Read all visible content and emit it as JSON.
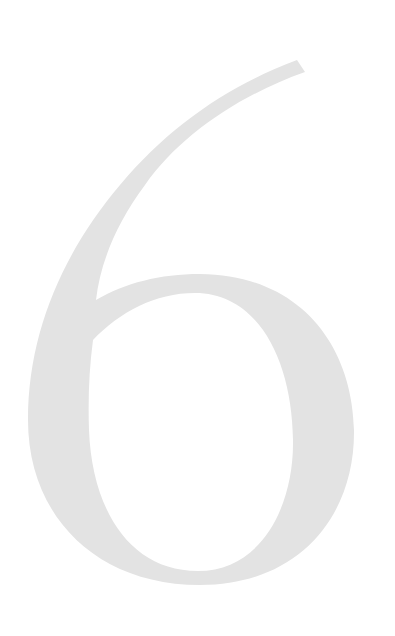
{
  "page": {
    "numeral": "6",
    "numeral_color": "#e3e3e3",
    "background_color": "#ffffff"
  }
}
